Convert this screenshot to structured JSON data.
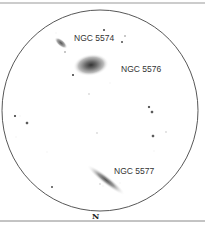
{
  "sketch": {
    "labels": [
      {
        "text": "NGC 5574"
      },
      {
        "text": "NGC 5576"
      },
      {
        "text": "NGC 5577"
      }
    ],
    "orientation": {
      "text": "N"
    },
    "colors": {
      "ink": "#333333",
      "border": "#888888",
      "background": "#ffffff"
    }
  }
}
